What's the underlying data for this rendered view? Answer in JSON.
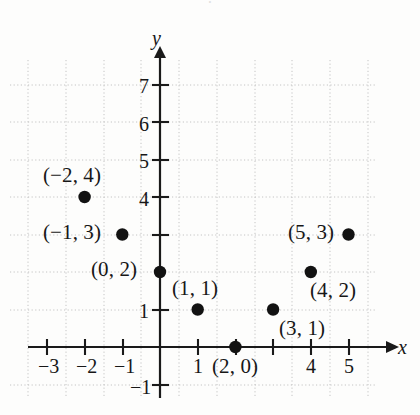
{
  "figure": {
    "background_color": "#fdfdfc",
    "axis_color": "#1a1a1a",
    "grid_color": "#c4c4c4",
    "point_color": "#121212",
    "text_color": "#171717"
  },
  "chart_data": {
    "type": "scatter",
    "title": "",
    "xlabel": "x",
    "ylabel": "y",
    "grid": true,
    "legend": "none",
    "xlim": [
      -3.6,
      5.8
    ],
    "ylim": [
      -1.6,
      7.7
    ],
    "xticks": [
      -3,
      -2,
      -1,
      1,
      2,
      3,
      4,
      5
    ],
    "yticks": [
      -1,
      1,
      2,
      3,
      4,
      5,
      6,
      7
    ],
    "xtick_labels_visible": [
      "-3",
      "-2",
      "-1",
      "1",
      "4",
      "5"
    ],
    "ytick_labels_visible": [
      "7",
      "6",
      "5",
      "4",
      "1",
      "-1"
    ],
    "points": [
      {
        "x": -2,
        "y": 4,
        "label": "(−2, 4)"
      },
      {
        "x": -1,
        "y": 3,
        "label": "(−1, 3)"
      },
      {
        "x": 0,
        "y": 2,
        "label": "(0, 2)"
      },
      {
        "x": 1,
        "y": 1,
        "label": "(1, 1)"
      },
      {
        "x": 2,
        "y": 0,
        "label": "(2, 0)"
      },
      {
        "x": 3,
        "y": 1,
        "label": "(3, 1)"
      },
      {
        "x": 4,
        "y": 2,
        "label": "(4, 2)"
      },
      {
        "x": 5,
        "y": 3,
        "label": "(5, 3)"
      }
    ]
  },
  "axis_labels": {
    "x_name": "x",
    "y_name": "y"
  },
  "tick_labels": {
    "x": [
      {
        "text": "−3",
        "left": 38,
        "top": 356
      },
      {
        "text": "−2",
        "left": 76,
        "top": 356
      },
      {
        "text": "−1",
        "left": 114,
        "top": 356
      },
      {
        "text": "1",
        "left": 193,
        "top": 356
      },
      {
        "text": "4",
        "left": 306,
        "top": 356
      },
      {
        "text": "5",
        "left": 344,
        "top": 356
      }
    ],
    "y": [
      {
        "text": "7",
        "left": 139,
        "top": 76
      },
      {
        "text": "6",
        "left": 139,
        "top": 114
      },
      {
        "text": "5",
        "left": 139,
        "top": 151
      },
      {
        "text": "4",
        "left": 139,
        "top": 189
      },
      {
        "text": "1",
        "left": 139,
        "top": 301
      },
      {
        "text": "−1",
        "left": 130,
        "top": 377
      }
    ]
  },
  "point_labels": [
    {
      "text": "(−2, 4)",
      "left": 43,
      "top": 165,
      "name": "point-label-neg2-4"
    },
    {
      "text": "(−1, 3)",
      "left": 43,
      "top": 222,
      "name": "point-label-neg1-3"
    },
    {
      "text": "(0, 2)",
      "left": 91,
      "top": 259,
      "name": "point-label-0-2"
    },
    {
      "text": "(1, 1)",
      "left": 172,
      "top": 278,
      "name": "point-label-1-1"
    },
    {
      "text": "(2, 0)",
      "left": 212,
      "top": 356,
      "name": "point-label-2-0"
    },
    {
      "text": "(3, 1)",
      "left": 279,
      "top": 318,
      "name": "point-label-3-1"
    },
    {
      "text": "(4, 2)",
      "left": 310,
      "top": 280,
      "name": "point-label-4-2"
    },
    {
      "text": "(5, 3)",
      "left": 288,
      "top": 222,
      "name": "point-label-5-3"
    }
  ],
  "axis_name_positions": {
    "x": {
      "left": 398,
      "top": 337
    },
    "y": {
      "left": 152,
      "top": 28
    }
  },
  "top_bleed_text": "·"
}
